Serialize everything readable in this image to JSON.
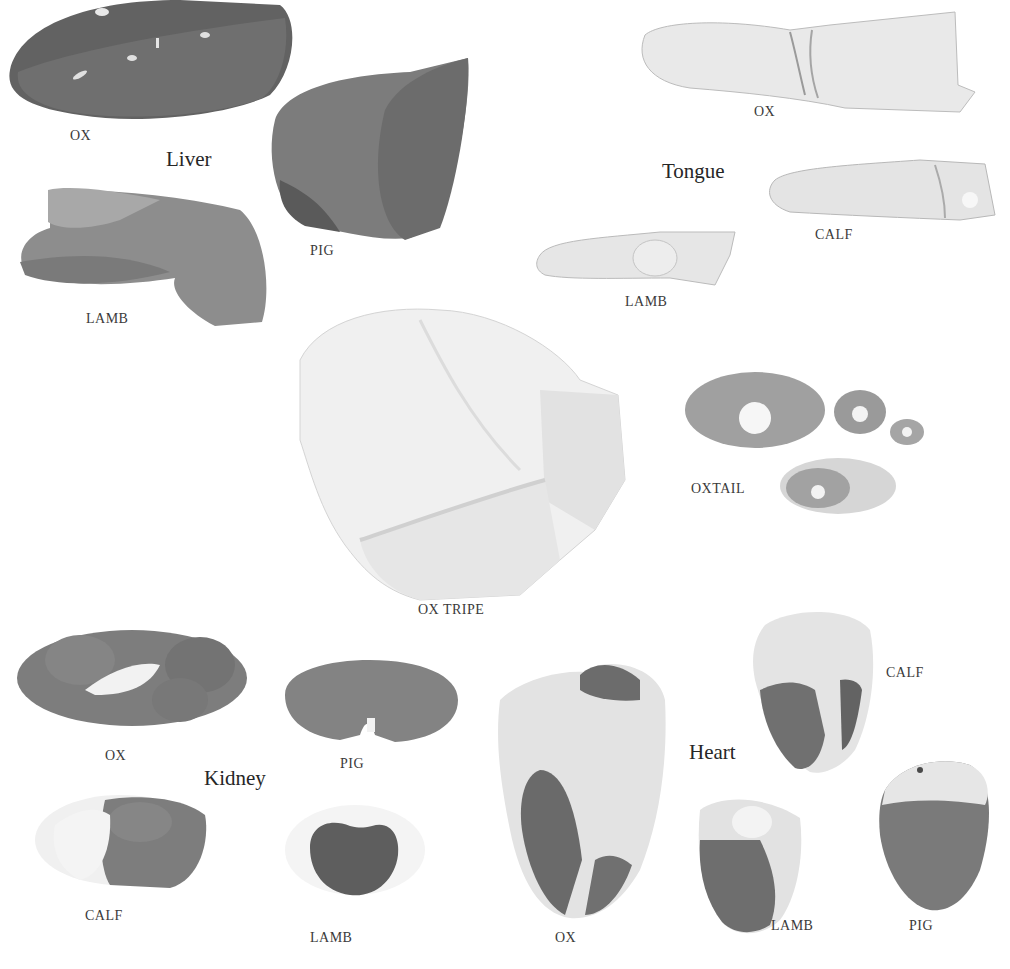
{
  "plate": {
    "groups": [
      {
        "id": "liver",
        "title": "Liver",
        "items": [
          {
            "label": "OX"
          },
          {
            "label": "PIG"
          },
          {
            "label": "LAMB"
          }
        ]
      },
      {
        "id": "tongue",
        "title": "Tongue",
        "items": [
          {
            "label": "OX"
          },
          {
            "label": "CALF"
          },
          {
            "label": "LAMB"
          }
        ]
      },
      {
        "id": "tripe",
        "items": [
          {
            "label": "OX TRIPE"
          }
        ]
      },
      {
        "id": "oxtail",
        "items": [
          {
            "label": "OXTAIL"
          }
        ]
      },
      {
        "id": "kidney",
        "title": "Kidney",
        "items": [
          {
            "label": "OX"
          },
          {
            "label": "PIG"
          },
          {
            "label": "CALF"
          },
          {
            "label": "LAMB"
          }
        ]
      },
      {
        "id": "heart",
        "title": "Heart",
        "items": [
          {
            "label": "OX"
          },
          {
            "label": "CALF"
          },
          {
            "label": "LAMB"
          },
          {
            "label": "PIG"
          }
        ]
      }
    ]
  },
  "colors": {
    "background": "#ffffff",
    "dark_organ": "#5e5e5e",
    "mid_organ": "#8a8a8a",
    "light_organ": "#e6e6e6",
    "fat": "#f2f2f2"
  }
}
